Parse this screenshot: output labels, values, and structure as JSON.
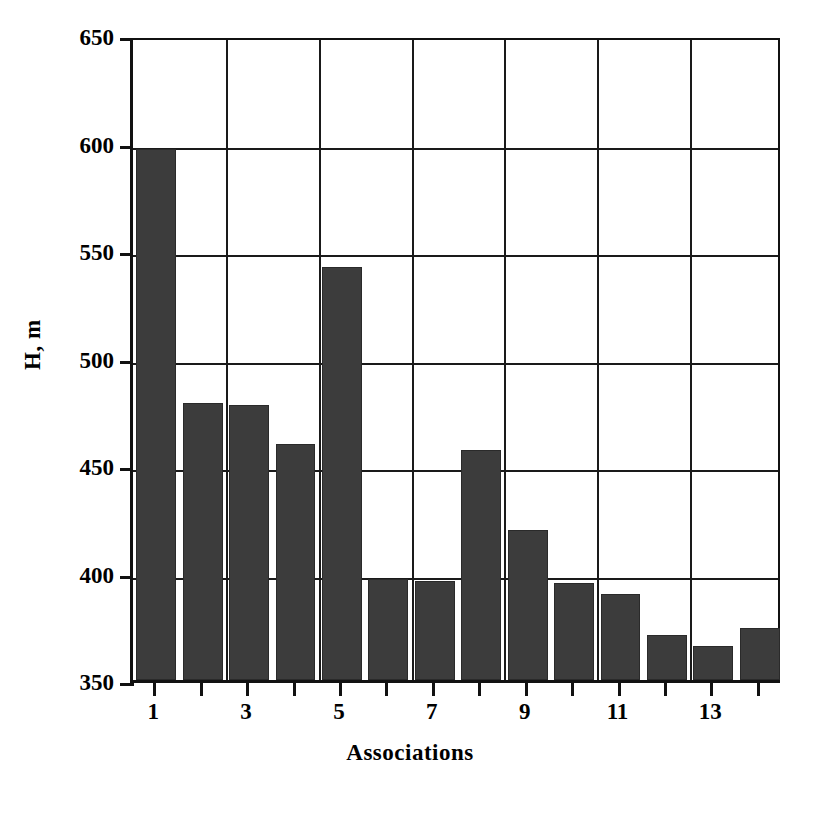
{
  "chart_data": {
    "type": "bar",
    "title": "",
    "xlabel": "Associations",
    "ylabel": "H, m",
    "categories": [
      "1",
      "2",
      "3",
      "4",
      "5",
      "6",
      "7",
      "8",
      "9",
      "10",
      "11",
      "12",
      "13",
      "14"
    ],
    "values": [
      597,
      479,
      478,
      460,
      542,
      397,
      396,
      457,
      420,
      395,
      390,
      371,
      366,
      374
    ],
    "series": [
      {
        "name": "H",
        "values": [
          597,
          479,
          478,
          460,
          542,
          397,
          396,
          457,
          420,
          395,
          390,
          371,
          366,
          374
        ]
      }
    ],
    "ylim": [
      350,
      650
    ],
    "xlim": [
      0.5,
      14.5
    ],
    "y_ticks": [
      350,
      400,
      450,
      500,
      550,
      600,
      650
    ],
    "y_tick_labels": [
      "350",
      "400",
      "450",
      "500",
      "550",
      "600",
      "650"
    ],
    "x_ticks": [
      1,
      2,
      3,
      4,
      5,
      6,
      7,
      8,
      9,
      10,
      11,
      12,
      13,
      14
    ],
    "x_tick_labels": [
      "1",
      "",
      "3",
      "",
      "5",
      "",
      "7",
      "",
      "9",
      "",
      "11",
      "",
      "13",
      ""
    ],
    "x_major_gridlines": [
      2.5,
      4.5,
      6.5,
      8.5,
      10.5,
      12.5
    ],
    "grid": true,
    "legend": "none",
    "bar_color": "#3c3c3c",
    "axis_color": "#111111",
    "background": "#ffffff"
  }
}
